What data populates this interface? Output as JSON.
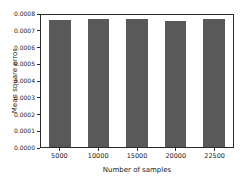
{
  "chart_data": {
    "type": "bar",
    "title": "",
    "xlabel": "Number of samples",
    "ylabel": "Mean square error",
    "categories": [
      "5000",
      "10000",
      "15000",
      "20000",
      "22500"
    ],
    "values": [
      0.000772,
      0.000775,
      0.000776,
      0.000765,
      0.000775
    ],
    "ylim": [
      0.0,
      0.0008
    ],
    "yticks": [
      "0.0000",
      "0.0001",
      "0.0002",
      "0.0003",
      "0.0004",
      "0.0005",
      "0.0006",
      "0.0007",
      "0.0008"
    ],
    "ytick_values": [
      0.0,
      0.0001,
      0.0002,
      0.0003,
      0.0004,
      0.0005,
      0.0006,
      0.0007,
      0.0008
    ],
    "grid": false,
    "legend": false,
    "bar_color": "#595959",
    "axis_color": "#2b2b2b",
    "background": "#ffffff"
  }
}
